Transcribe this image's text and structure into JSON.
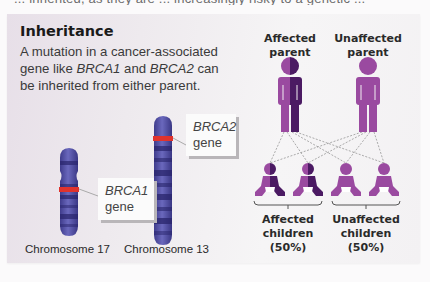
{
  "cutoff_text": "... inherited, as they are ... increasingly risky to a genetic ... ",
  "title": "Inheritance",
  "description": {
    "part1": "A mutation in a cancer-associated gene like ",
    "gene1": "BRCA1",
    "part2": " and ",
    "gene2": "BRCA2",
    "part3": " can be inherited from either parent."
  },
  "chromosomes": [
    {
      "label": "Chromosome 17",
      "gene": "BRCA1",
      "gene_suffix": "gene"
    },
    {
      "label": "Chromosome 13",
      "gene": "BRCA2",
      "gene_suffix": "gene"
    }
  ],
  "parents": [
    {
      "label_line1": "Affected",
      "label_line2": "parent",
      "affected": true
    },
    {
      "label_line1": "Unaffected",
      "label_line2": "parent",
      "affected": false
    }
  ],
  "children_groups": [
    {
      "label_line1": "Affected",
      "label_line2": "children",
      "label_line3": "(50%)",
      "count": 2,
      "affected": true
    },
    {
      "label_line1": "Unaffected",
      "label_line2": "children",
      "label_line3": "(50%)",
      "count": 2,
      "affected": false
    }
  ],
  "colors": {
    "figure_light": "#9a4aa0",
    "figure_dark": "#4b1a63",
    "chromosome": "#4c4aa0",
    "chromosome_band": "#28246b",
    "gene_marker": "#e0332d",
    "connector": "#8a8a8a"
  }
}
